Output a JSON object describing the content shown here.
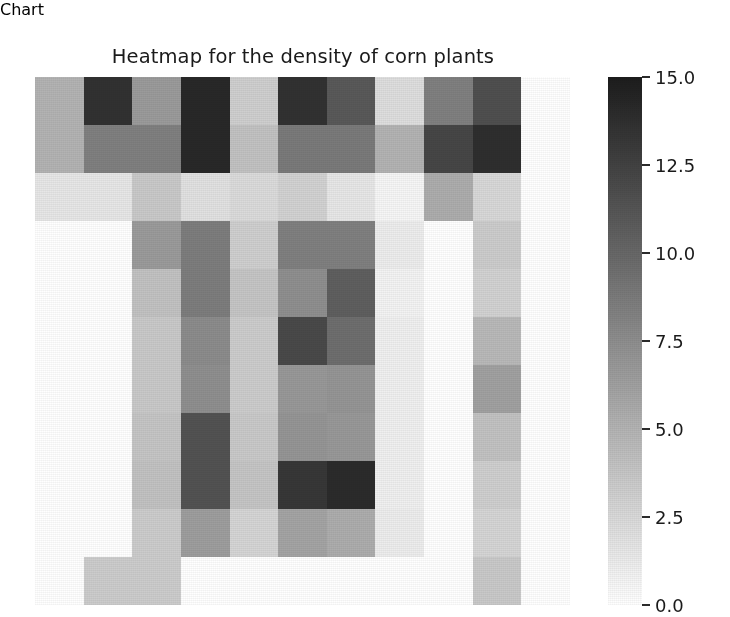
{
  "chart": {
    "title": "Heatmap for the density of corn plants"
  },
  "colorbar": {
    "ticks": [
      "15.0",
      "12.5",
      "10.0",
      "7.5",
      "5.0",
      "2.5",
      "0.0"
    ],
    "tick_values": [
      15.0,
      12.5,
      10.0,
      7.5,
      5.0,
      2.5,
      0.0
    ],
    "vmin": 0.0,
    "vmax": 15.0,
    "colormap": "gray_r",
    "low_color": "#ffffff",
    "high_color": "#1c1c1c",
    "orientation": "vertical"
  },
  "chart_data": {
    "type": "heatmap",
    "title": "Heatmap for the density of corn plants",
    "xlabel": "",
    "ylabel": "",
    "grid": false,
    "legend": "colorbar-right",
    "colormap": "gray_r",
    "vmin": 0.0,
    "vmax": 15.0,
    "rows": 11,
    "cols": 11,
    "x": [
      0,
      1,
      2,
      3,
      4,
      5,
      6,
      7,
      8,
      9,
      10
    ],
    "y": [
      0,
      1,
      2,
      3,
      4,
      5,
      6,
      7,
      8,
      9,
      10
    ],
    "xticklabels": [],
    "yticklabels": [],
    "values": [
      [
        5.0,
        13.6,
        6.6,
        14.2,
        3.2,
        13.6,
        11.0,
        2.2,
        8.4,
        11.6,
        0.0
      ],
      [
        5.0,
        8.4,
        8.4,
        14.2,
        4.0,
        8.8,
        8.8,
        5.0,
        12.2,
        13.8,
        0.0
      ],
      [
        1.6,
        1.6,
        3.6,
        2.0,
        2.4,
        3.0,
        1.6,
        0.6,
        5.4,
        2.6,
        0.0
      ],
      [
        0.0,
        0.0,
        6.6,
        8.6,
        3.2,
        8.4,
        8.4,
        1.2,
        0.0,
        3.4,
        0.0
      ],
      [
        0.0,
        0.0,
        4.0,
        8.6,
        3.8,
        7.4,
        10.6,
        0.8,
        0.0,
        3.0,
        0.0
      ],
      [
        0.0,
        0.0,
        3.6,
        7.6,
        3.4,
        12.0,
        9.6,
        1.0,
        0.0,
        4.6,
        0.0
      ],
      [
        0.0,
        0.0,
        3.6,
        7.4,
        3.4,
        6.8,
        7.0,
        1.0,
        0.0,
        6.2,
        0.0
      ],
      [
        0.0,
        0.0,
        3.8,
        11.4,
        3.6,
        7.0,
        6.8,
        1.0,
        0.0,
        4.0,
        0.0
      ],
      [
        0.0,
        0.0,
        4.0,
        11.4,
        3.8,
        13.2,
        14.0,
        1.0,
        0.0,
        3.2,
        0.0
      ],
      [
        0.0,
        0.0,
        3.4,
        6.4,
        2.8,
        6.0,
        5.4,
        1.2,
        0.0,
        2.8,
        0.0
      ],
      [
        0.0,
        3.4,
        3.4,
        0.0,
        0.0,
        0.0,
        0.0,
        0.0,
        0.0,
        3.6,
        0.0
      ]
    ]
  }
}
